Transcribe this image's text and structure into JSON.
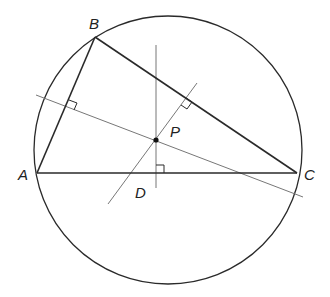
{
  "diagram": {
    "colors": {
      "stroke": "#2a2a2a",
      "thin": "#777777",
      "background": "#ffffff"
    },
    "circle": {
      "cx": 168,
      "cy": 150,
      "r": 134
    },
    "points": {
      "A": {
        "label": "A",
        "x": 37,
        "y": 173,
        "lx": 18,
        "ly": 180
      },
      "B": {
        "label": "B",
        "x": 95,
        "y": 37,
        "lx": 89,
        "ly": 29
      },
      "C": {
        "label": "C",
        "x": 297,
        "y": 173,
        "lx": 304,
        "ly": 180
      },
      "P": {
        "label": "P",
        "x": 156,
        "y": 140,
        "lx": 170,
        "ly": 137
      },
      "D": {
        "label": "D",
        "x": 156,
        "y": 173,
        "lx": 135,
        "ly": 198
      }
    },
    "triangle_sides": [
      {
        "name": "AB",
        "x1": 37,
        "y1": 173,
        "x2": 95,
        "y2": 37
      },
      {
        "name": "BC",
        "x1": 95,
        "y1": 37,
        "x2": 297,
        "y2": 173
      },
      {
        "name": "AC",
        "x1": 37,
        "y1": 173,
        "x2": 297,
        "y2": 173
      }
    ],
    "bisectors": [
      {
        "name": "perp-bisector-AC",
        "x1": 156,
        "y1": 45,
        "x2": 156,
        "y2": 188
      },
      {
        "name": "perp-bisector-AB",
        "x1": 36,
        "y1": 95,
        "x2": 303,
        "y2": 197
      },
      {
        "name": "perp-bisector-BC",
        "x1": 197,
        "y1": 83,
        "x2": 108,
        "y2": 204
      }
    ],
    "right_angle_marks": [
      {
        "name": "right-angle-AC",
        "d": "M156 165 L164 165 L164 173"
      },
      {
        "name": "right-angle-AB",
        "d": "M69 100 L77 103 L74 110"
      },
      {
        "name": "right-angle-BC",
        "d": "M186 98 L192 102 L187 109 L181 105"
      }
    ]
  }
}
